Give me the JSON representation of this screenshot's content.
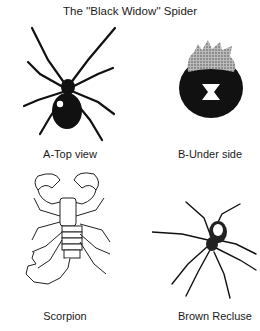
{
  "title": "The ''Black Widow'' Spider",
  "figures": [
    {
      "id": "A",
      "caption": "A-Top view",
      "subject": "black-widow-top"
    },
    {
      "id": "B",
      "caption": "B-Under side",
      "subject": "black-widow-underside"
    },
    {
      "id": "C",
      "caption": "Scorpion",
      "subject": "scorpion"
    },
    {
      "id": "D",
      "caption": "Brown Recluse",
      "subject": "brown-recluse"
    }
  ],
  "colors": {
    "ink": "#111111",
    "background": "#ffffff"
  }
}
